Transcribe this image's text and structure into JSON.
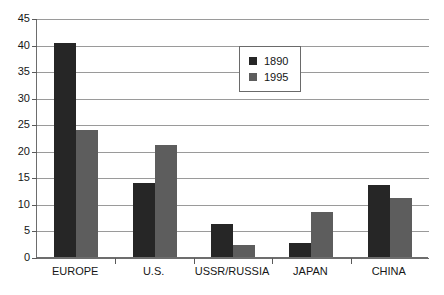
{
  "chart_data": {
    "type": "bar",
    "title": "",
    "subtitle": "",
    "xlabel": "",
    "ylabel": "",
    "categories": [
      "EUROPE",
      "U.S.",
      "USSR/RUSSIA",
      "JAPAN",
      "CHINA"
    ],
    "series": [
      {
        "name": "1890",
        "color": "#262626",
        "values": [
          40.3,
          14.0,
          6.3,
          2.6,
          13.6
        ]
      },
      {
        "name": "1995",
        "color": "#5d5d5d",
        "values": [
          23.9,
          21.0,
          2.3,
          8.5,
          11.2
        ]
      }
    ],
    "ylim": [
      0,
      45
    ],
    "ytick_step": 5,
    "yticks": [
      "0",
      "5",
      "10",
      "15",
      "20",
      "25",
      "30",
      "35",
      "40",
      "45"
    ],
    "grid": "horizontal",
    "legend_position": "inside-top-center-right",
    "legend_entries": [
      "1890",
      "1995"
    ]
  },
  "legend": {
    "entries": [
      {
        "label": "1890",
        "swatch": "legend-swatch-1890"
      },
      {
        "label": "1995",
        "swatch": "legend-swatch-1995"
      }
    ]
  }
}
